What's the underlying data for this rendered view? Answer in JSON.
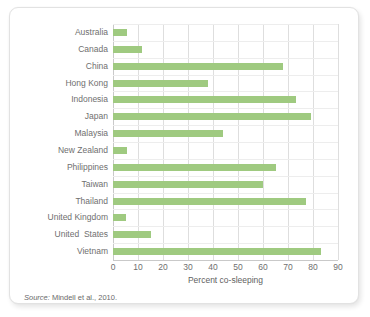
{
  "figure": {
    "source_prefix": "Source:",
    "source_text": " Mindell et al., 2010."
  },
  "colors": {
    "bar": "#9fca80",
    "gridline": "#dedede",
    "axis": "#c9c9c9",
    "label_text": "#6f6f6f",
    "card_border": "#e2e2e2"
  },
  "chart_data": {
    "type": "bar",
    "orientation": "horizontal",
    "title": "",
    "xlabel": "Percent co-sleeping",
    "ylabel": "",
    "xlim": [
      0,
      90
    ],
    "xticks": [
      0,
      10,
      20,
      30,
      40,
      50,
      60,
      70,
      80,
      90
    ],
    "xtick_labels": [
      "0",
      "10",
      "20",
      "30",
      "40",
      "50",
      "60",
      "70",
      "80",
      "90"
    ],
    "grid": true,
    "legend": false,
    "categories": [
      "Australia",
      "Canada",
      "China",
      "Hong Kong",
      "Indonesia",
      "Japan",
      "Malaysia",
      "New Zealand",
      "Philippines",
      "Taiwan",
      "Thailand",
      "United Kingdom",
      "United  States",
      "Vietnam"
    ],
    "values": [
      5.5,
      11.5,
      68,
      38,
      73,
      79,
      44,
      5.5,
      65,
      60,
      77,
      5,
      15,
      83
    ]
  }
}
